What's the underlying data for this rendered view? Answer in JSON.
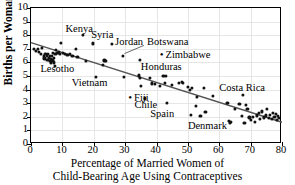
{
  "chart_data": {
    "type": "scatter",
    "title": "",
    "xlabel": "Percentage of Married Women of Child-Bearing Age Using Contraceptives",
    "xlabel_line1": "Percentage of Married Women of",
    "xlabel_line2": "Child-Bearing Age Using Contraceptives",
    "ylabel": "Births per Woman",
    "xlim": [
      0,
      80
    ],
    "ylim": [
      0,
      10
    ],
    "xticks": [
      0,
      10,
      20,
      30,
      40,
      50,
      60,
      70,
      80
    ],
    "yticks": [
      0,
      1,
      2,
      3,
      4,
      5,
      6,
      7,
      8,
      9,
      10
    ],
    "grid": true,
    "legend": "none",
    "point_color": "#111111",
    "line_color": "#555555",
    "trendline": {
      "label": "least-squares regression line",
      "x": [
        0,
        80
      ],
      "y": [
        7.45,
        1.6
      ]
    },
    "points": [
      [
        1.0,
        7.0
      ],
      [
        1.6,
        6.85
      ],
      [
        2.3,
        7.0
      ],
      [
        2.6,
        6.75
      ],
      [
        3.2,
        6.6
      ],
      [
        3.6,
        7.05
      ],
      [
        4.0,
        6.5
      ],
      [
        4.3,
        6.3
      ],
      [
        4.6,
        6.6
      ],
      [
        5.0,
        6.45
      ],
      [
        5.2,
        6.2
      ],
      [
        5.5,
        6.6
      ],
      [
        5.7,
        6.35
      ],
      [
        5.9,
        6.1
      ],
      [
        6.1,
        6.5
      ],
      [
        6.3,
        6.25
      ],
      [
        6.4,
        5.95
      ],
      [
        6.6,
        6.45
      ],
      [
        6.8,
        6.15
      ],
      [
        7.0,
        6.7
      ],
      [
        7.2,
        6.35
      ],
      [
        7.4,
        6.0
      ],
      [
        7.6,
        5.75
      ],
      [
        7.8,
        6.6
      ],
      [
        8.0,
        6.9
      ],
      [
        8.4,
        6.7
      ],
      [
        8.8,
        6.75
      ],
      [
        9.2,
        6.6
      ],
      [
        9.6,
        7.45
      ],
      [
        10.2,
        6.7
      ],
      [
        10.8,
        6.65
      ],
      [
        11.6,
        6.55
      ],
      [
        12.4,
        6.65
      ],
      [
        13.2,
        6.5
      ],
      [
        14.2,
        7.0
      ],
      [
        14.8,
        6.4
      ],
      [
        16.6,
        8.0
      ],
      [
        17.4,
        6.1
      ],
      [
        19.8,
        7.4
      ],
      [
        20.6,
        4.95
      ],
      [
        22.8,
        5.8
      ],
      [
        23.4,
        6.15
      ],
      [
        24.0,
        6.1
      ],
      [
        25.8,
        7.35
      ],
      [
        29.4,
        6.5
      ],
      [
        29.6,
        4.95
      ],
      [
        34.6,
        6.2
      ],
      [
        34.4,
        5.05
      ],
      [
        34.8,
        4.85
      ],
      [
        35.0,
        4.25
      ],
      [
        36.4,
        3.35
      ],
      [
        37.8,
        4.85
      ],
      [
        38.6,
        4.45
      ],
      [
        39.6,
        4.4
      ],
      [
        41.0,
        4.3
      ],
      [
        42.2,
        5.0
      ],
      [
        42.6,
        4.5
      ],
      [
        43.0,
        5.0
      ],
      [
        43.4,
        3.05
      ],
      [
        44.8,
        4.35
      ],
      [
        47.2,
        4.5
      ],
      [
        48.2,
        4.55
      ],
      [
        48.4,
        4.5
      ],
      [
        50.0,
        4.2
      ],
      [
        50.6,
        3.95
      ],
      [
        51.0,
        2.15
      ],
      [
        51.4,
        4.1
      ],
      [
        52.6,
        2.8
      ],
      [
        53.0,
        3.45
      ],
      [
        54.0,
        2.05
      ],
      [
        55.0,
        4.1
      ],
      [
        55.6,
        2.35
      ],
      [
        58.0,
        3.55
      ],
      [
        62.6,
        3.0
      ],
      [
        63.0,
        1.7
      ],
      [
        63.4,
        1.55
      ],
      [
        63.8,
        1.6
      ],
      [
        65.0,
        2.6
      ],
      [
        66.4,
        2.95
      ],
      [
        67.2,
        2.05
      ],
      [
        67.6,
        3.6
      ],
      [
        68.0,
        1.55
      ],
      [
        68.4,
        2.9
      ],
      [
        69.0,
        2.6
      ],
      [
        69.6,
        1.95
      ],
      [
        70.2,
        1.75
      ],
      [
        70.8,
        2.0
      ],
      [
        71.4,
        1.65
      ],
      [
        72.0,
        2.1
      ],
      [
        72.6,
        2.3
      ],
      [
        73.0,
        1.85
      ],
      [
        73.6,
        2.4
      ],
      [
        74.2,
        1.95
      ],
      [
        74.8,
        2.1
      ],
      [
        75.2,
        2.6
      ],
      [
        75.8,
        1.9
      ],
      [
        76.2,
        2.15
      ],
      [
        76.8,
        1.85
      ],
      [
        77.2,
        2.3
      ],
      [
        77.6,
        2.0
      ],
      [
        78.0,
        2.2
      ],
      [
        78.4,
        1.75
      ],
      [
        78.8,
        2.05
      ],
      [
        79.0,
        1.9
      ]
    ],
    "annotations": [
      {
        "name": "kenya",
        "text": "Kenya",
        "x": 11.0,
        "y": 8.45,
        "leader": false
      },
      {
        "name": "syria",
        "text": "Syria",
        "x": 19.2,
        "y": 8.0,
        "leader": false
      },
      {
        "name": "jordan",
        "text": "Jordan",
        "x": 26.8,
        "y": 7.5,
        "leader": false
      },
      {
        "name": "botswana",
        "text": "Botswana",
        "x": 37.0,
        "y": 7.5,
        "leader": true,
        "leader_from": [
          36.0,
          7.25
        ],
        "leader_to": [
          29.8,
          6.65
        ]
      },
      {
        "name": "zimbabwe",
        "text": "Zimbabwe",
        "x": 41.0,
        "y": 6.55,
        "dot": true
      },
      {
        "name": "honduras",
        "text": "Honduras",
        "x": 35.0,
        "y": 5.65,
        "leader": false
      },
      {
        "name": "lesotho",
        "text": "Lesotho",
        "x": 3.0,
        "y": 5.5,
        "leader": false
      },
      {
        "name": "vietnam",
        "text": "Vietnam",
        "x": 13.0,
        "y": 4.45,
        "leader": false
      },
      {
        "name": "fiji",
        "text": "Fiji",
        "x": 31.0,
        "y": 3.35,
        "dot": true
      },
      {
        "name": "chile",
        "text": "Chile",
        "x": 33.0,
        "y": 2.85,
        "leader": false
      },
      {
        "name": "spain",
        "text": "Spain",
        "x": 38.0,
        "y": 2.2,
        "leader": false
      },
      {
        "name": "denmark",
        "text": "Denmark",
        "x": 50.0,
        "y": 1.3,
        "leader": false
      },
      {
        "name": "costa-rica",
        "text": "Costa Rica",
        "x": 60.0,
        "y": 4.15,
        "leader": false
      }
    ]
  }
}
